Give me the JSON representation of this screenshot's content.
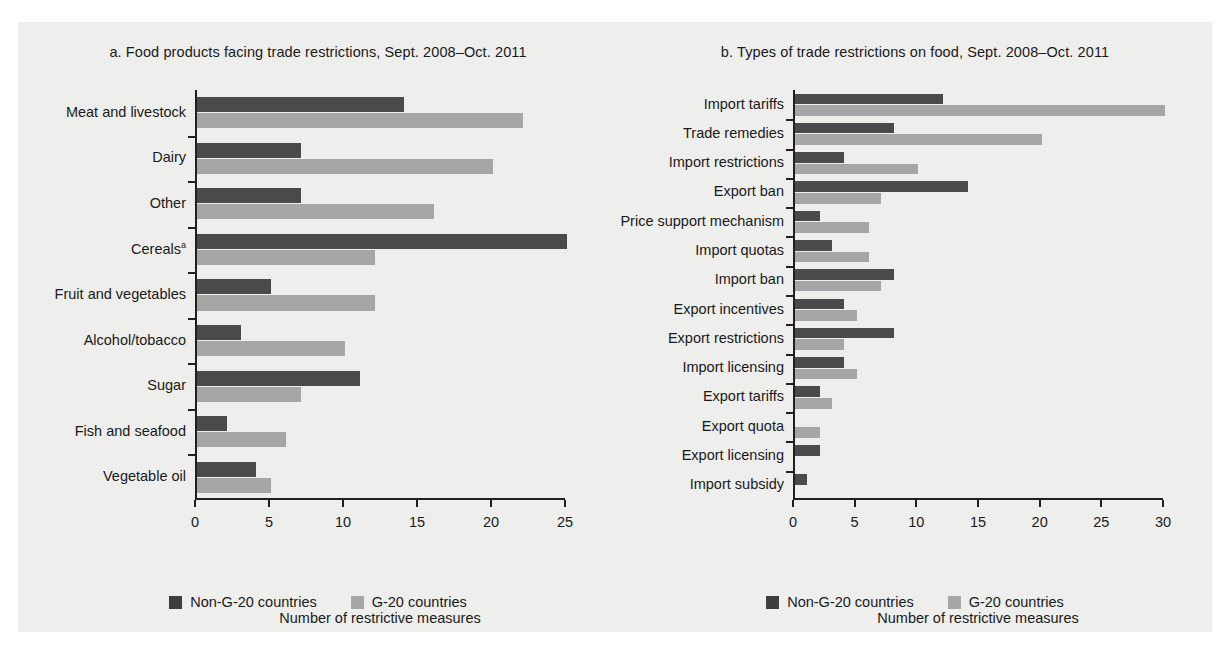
{
  "figure": {
    "background": "#eeeeec",
    "colors": {
      "non_g20": "#4a4a4a",
      "g20": "#a6a6a6",
      "axis": "#231f20"
    }
  },
  "legend": {
    "items": [
      {
        "label": "Non-G-20 countries",
        "color": "#4a4a4a",
        "key": "non_g20"
      },
      {
        "label": "G-20 countries",
        "color": "#a6a6a6",
        "key": "g20"
      }
    ]
  },
  "chart_data": [
    {
      "id": "a",
      "type": "bar",
      "orientation": "horizontal",
      "title": "a.  Food products facing trade restrictions, Sept. 2008–Oct. 2011",
      "panel_letter": "a.",
      "xlabel": "Number of restrictive measures",
      "ylabel": "",
      "xlim": [
        0,
        25
      ],
      "xticks": [
        0,
        5,
        10,
        15,
        20,
        25
      ],
      "xticklabels": [
        "0",
        "5",
        "10",
        "15",
        "20",
        "25"
      ],
      "grid": false,
      "legend_position": "bottom-center",
      "categories": [
        "Meat and livestock",
        "Dairy",
        "Other",
        "Cereals",
        "Fruit and vegetables",
        "Alcohol/tobacco",
        "Sugar",
        "Fish and seafood",
        "Vegetable oil"
      ],
      "category_footnotes": {
        "Cereals": "a"
      },
      "series": [
        {
          "name": "Non-G-20 countries",
          "values": [
            14,
            7,
            7,
            25,
            5,
            3,
            11,
            2,
            4
          ]
        },
        {
          "name": "G-20 countries",
          "values": [
            22,
            20,
            16,
            12,
            12,
            10,
            7,
            6,
            5
          ]
        }
      ]
    },
    {
      "id": "b",
      "type": "bar",
      "orientation": "horizontal",
      "title": "b.  Types of trade restrictions on food, Sept. 2008–Oct. 2011",
      "panel_letter": "b.",
      "xlabel": "Number of restrictive measures",
      "ylabel": "",
      "xlim": [
        0,
        30
      ],
      "xticks": [
        0,
        5,
        10,
        15,
        20,
        25,
        30
      ],
      "xticklabels": [
        "0",
        "5",
        "10",
        "15",
        "20",
        "25",
        "30"
      ],
      "grid": false,
      "legend_position": "bottom-center",
      "categories": [
        "Import tariffs",
        "Trade remedies",
        "Import restrictions",
        "Export ban",
        "Price support mechanism",
        "Import quotas",
        "Import ban",
        "Export incentives",
        "Export restrictions",
        "Import licensing",
        "Export tariffs",
        "Export quota",
        "Export licensing",
        "Import subsidy"
      ],
      "series": [
        {
          "name": "Non-G-20 countries",
          "values": [
            12,
            8,
            4,
            14,
            2,
            3,
            8,
            4,
            8,
            4,
            2,
            0,
            2,
            1
          ]
        },
        {
          "name": "G-20 countries",
          "values": [
            30,
            20,
            10,
            7,
            6,
            6,
            7,
            5,
            4,
            5,
            3,
            2,
            0,
            0
          ]
        }
      ]
    }
  ]
}
